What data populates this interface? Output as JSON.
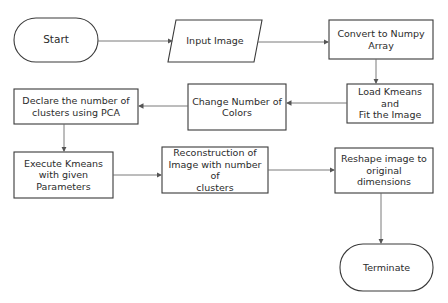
{
  "diagram": {
    "type": "flowchart",
    "colors": {
      "stroke": "#3a3a3a",
      "text": "#2b2b2b",
      "background": "#ffffff",
      "arrow": "#6b6b6b"
    },
    "nodes": [
      {
        "id": "start",
        "shape": "terminator",
        "label": "Start"
      },
      {
        "id": "input",
        "shape": "parallelogram",
        "label": "Input Image"
      },
      {
        "id": "convert",
        "shape": "rectangle",
        "label": "Convert to Numpy\nArray"
      },
      {
        "id": "load",
        "shape": "rectangle",
        "label": "Load Kmeans\nand\nFit the Image"
      },
      {
        "id": "change",
        "shape": "rectangle",
        "label": "Change Number of\nColors"
      },
      {
        "id": "declare",
        "shape": "rectangle",
        "label": "Declare the number of\nclusters using PCA"
      },
      {
        "id": "execute",
        "shape": "rectangle",
        "label": "Execute Kmeans\nwith given\nParameters"
      },
      {
        "id": "reconstruct",
        "shape": "rectangle",
        "label": "Reconstruction of\nImage with number of\nclusters"
      },
      {
        "id": "reshape",
        "shape": "rectangle",
        "label": "Reshape image to\noriginal dimensions"
      },
      {
        "id": "terminate",
        "shape": "terminator",
        "label": "Terminate"
      }
    ],
    "edges": [
      {
        "from": "start",
        "to": "input"
      },
      {
        "from": "input",
        "to": "convert"
      },
      {
        "from": "convert",
        "to": "load"
      },
      {
        "from": "load",
        "to": "change"
      },
      {
        "from": "change",
        "to": "declare"
      },
      {
        "from": "declare",
        "to": "execute"
      },
      {
        "from": "execute",
        "to": "reconstruct"
      },
      {
        "from": "reconstruct",
        "to": "reshape"
      },
      {
        "from": "reshape",
        "to": "terminate"
      }
    ]
  }
}
